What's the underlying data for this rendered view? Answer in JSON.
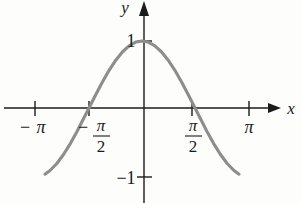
{
  "figure": {
    "kind": "math-graph",
    "background_color": "#fdfdfc",
    "axis_color": "#1b1b1b",
    "curve_color": "#8d8d8d",
    "text_color": "#1b1b1b"
  },
  "axes": {
    "x_axis_label": "x",
    "y_axis_label": "y",
    "x_ticks": [
      {
        "label": "−π",
        "display": "-pi",
        "value": -3.14159,
        "px": 35
      },
      {
        "label": "−π/2",
        "display": "-pi/2",
        "value": -1.5708,
        "px": 89
      },
      {
        "label": "π/2",
        "display": "pi/2",
        "value": 1.5708,
        "px": 192
      },
      {
        "label": "π",
        "display": "pi",
        "value": 3.14159,
        "px": 249
      }
    ],
    "y_ticks": [
      {
        "label": "1",
        "value": 1,
        "px": 41
      },
      {
        "label": "−1",
        "value": -1,
        "px": 177
      }
    ],
    "minus_sign": "−",
    "pi_symbol": "π",
    "half_denominator": "2",
    "one_label": "1",
    "negative_one_label": "−1"
  },
  "chart_data": {
    "type": "line",
    "title": "",
    "subtitle": "",
    "xlabel": "x",
    "ylabel": "y",
    "grid": false,
    "legend": null,
    "xlim": [
      -4.0,
      4.0
    ],
    "ylim": [
      -1.35,
      1.35
    ],
    "xticks": [
      -3.14159,
      -1.5708,
      1.5708,
      3.14159
    ],
    "xticklabels": [
      "−π",
      "−π/2",
      "π/2",
      "π"
    ],
    "yticks": [
      1,
      -1
    ],
    "yticklabels": [
      "1",
      "−1"
    ],
    "series": [
      {
        "name": "y = cos x",
        "color": "#8d8d8d",
        "x": [
          -2.85,
          -2.7,
          -2.5,
          -2.3,
          -2.1,
          -1.9,
          -1.7708,
          -1.5708,
          -1.37,
          -1.17,
          -0.97,
          -0.77,
          -0.57,
          -0.37,
          -0.17,
          0.0,
          0.17,
          0.37,
          0.57,
          0.77,
          0.97,
          1.17,
          1.37,
          1.5708,
          1.7708,
          1.9,
          2.1,
          2.3,
          2.5,
          2.7,
          2.85
        ],
        "y": [
          -0.958,
          -0.904,
          -0.801,
          -0.666,
          -0.505,
          -0.323,
          -0.195,
          0.0,
          0.199,
          0.39,
          0.565,
          0.718,
          0.842,
          0.932,
          0.986,
          1.0,
          0.986,
          0.932,
          0.842,
          0.718,
          0.565,
          0.39,
          0.199,
          0.0,
          -0.195,
          -0.323,
          -0.505,
          -0.666,
          -0.801,
          -0.904,
          -0.958
        ]
      }
    ]
  },
  "arrows": {
    "x_axis_arrow": "arrow-right",
    "y_axis_arrow": "arrow-up"
  }
}
